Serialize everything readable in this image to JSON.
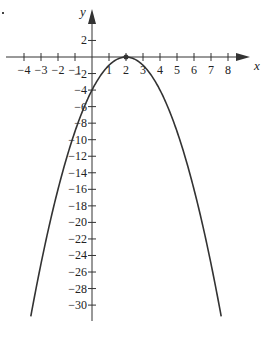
{
  "chart_data": {
    "type": "line",
    "title": "",
    "xlabel": "x",
    "ylabel": "y",
    "function": "y = -(x - 2)^2",
    "series": [
      {
        "name": "parabola",
        "x": [
          -3.6,
          -3,
          -2,
          -1,
          0,
          1,
          2,
          3,
          4,
          5,
          6,
          7,
          7.6
        ],
        "y": [
          -31.36,
          -25,
          -16,
          -9,
          -4,
          -1,
          0,
          -1,
          -4,
          -9,
          -16,
          -25,
          -31.36
        ]
      }
    ],
    "annotations": [
      {
        "type": "point",
        "x": 2,
        "y": 0,
        "label": "vertex"
      }
    ],
    "x_ticks": [
      "-4",
      "-3",
      "-2",
      "-1",
      "1",
      "2",
      "3",
      "4",
      "5",
      "6",
      "7",
      "8"
    ],
    "x_tick_values": [
      -4,
      -3,
      -2,
      -1,
      1,
      2,
      3,
      4,
      5,
      6,
      7,
      8
    ],
    "y_ticks": [
      "2",
      "-2",
      "-4",
      "-6",
      "-8",
      "-10",
      "-12",
      "-14",
      "-16",
      "-18",
      "-20",
      "-22",
      "-24",
      "-26",
      "-28",
      "-30"
    ],
    "y_tick_values": [
      2,
      -2,
      -4,
      -6,
      -8,
      -10,
      -12,
      -14,
      -16,
      -18,
      -20,
      -22,
      -24,
      -26,
      -28,
      -30
    ],
    "xlim": [
      -5,
      9.5
    ],
    "ylim": [
      -32,
      5.5
    ],
    "grid": false,
    "legend": null
  },
  "colors": {
    "curve": "#333333",
    "axis": "#333333",
    "background": "#ffffff"
  }
}
